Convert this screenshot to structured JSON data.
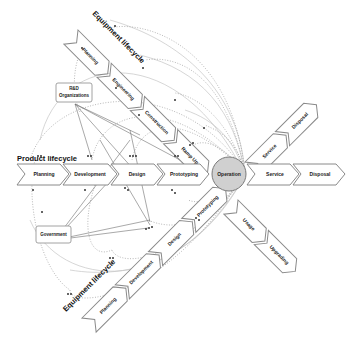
{
  "diagram": {
    "product_lifecycle": {
      "title": "Product lifecycle",
      "stages": [
        "Planning",
        "Development",
        "Design",
        "Prototyping"
      ]
    },
    "center": {
      "label": "Operation",
      "fill": "#d0d0d0"
    },
    "right_stages": [
      "Service",
      "Disposal"
    ],
    "upper_right_branch": [
      "Service",
      "Disposal"
    ],
    "lower_right_branch": [
      "Usage",
      "Upgrading"
    ],
    "equipment_lifecycle_top": {
      "title": "Equipment lifecycle",
      "stages": [
        "Planning",
        "Engineering",
        "Construction",
        "Ramp Up"
      ]
    },
    "equipment_lifecycle_bottom": {
      "title": "Equipment lifecycle",
      "stages": [
        "Planning",
        "Development",
        "Design",
        "Prototyping"
      ]
    },
    "actors": {
      "rd": "R&D Organizations",
      "rd_line1": "R&D",
      "rd_line2": "Organizations",
      "government": "Government"
    }
  }
}
